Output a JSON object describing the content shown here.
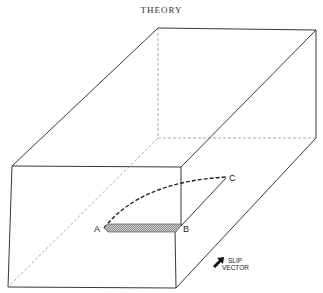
{
  "header": {
    "title": "THEORY"
  },
  "diagram": {
    "labels": {
      "a": "A",
      "b": "B",
      "c": "C"
    },
    "slip_vector": {
      "line1": "SLIP",
      "line2": "VECTOR"
    }
  }
}
